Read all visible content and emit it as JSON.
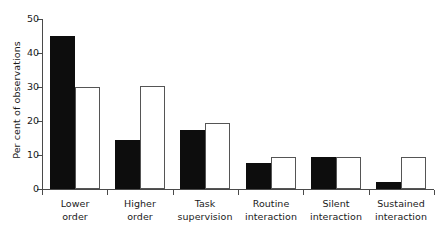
{
  "chart_data": {
    "type": "bar",
    "title": "",
    "subtitle": "",
    "xlabel": "",
    "ylabel": "Per cent of observations",
    "ylim": [
      0,
      50
    ],
    "yticks": [
      0,
      10,
      20,
      30,
      40,
      50
    ],
    "ytick_labels": [
      "0",
      "10",
      "20",
      "30",
      "40",
      "50"
    ],
    "grid": false,
    "legend": "none",
    "categories": [
      "Lower order",
      "Higher order",
      "Task supervision",
      "Routine interaction",
      "Silent interaction",
      "Sustained interaction"
    ],
    "category_lines": [
      [
        "Lower",
        "order"
      ],
      [
        "Higher",
        "order"
      ],
      [
        "Task",
        "supervision"
      ],
      [
        "Routine",
        "interaction"
      ],
      [
        "Silent",
        "interaction"
      ],
      [
        "Sustained",
        "interaction"
      ]
    ],
    "series": [
      {
        "name": "filled",
        "color": "#0d0d0d",
        "values": [
          45,
          14.3,
          17.5,
          7.6,
          9.4,
          2
        ]
      },
      {
        "name": "open",
        "color": "#ffffff",
        "values": [
          30,
          30.3,
          19.5,
          9.4,
          9.4,
          9.4
        ]
      }
    ]
  }
}
